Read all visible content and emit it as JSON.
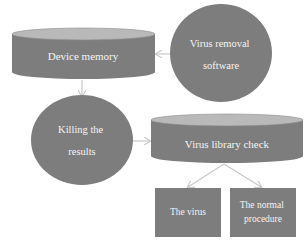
{
  "diagram": {
    "colors": {
      "shape_fill": "#7d7d7d",
      "cylinder_top": "#b9b9b9",
      "arrow": "#c8c8c8",
      "text": "#f4f4f4",
      "background": "#ffffff"
    },
    "nodes": {
      "device_memory": {
        "shape": "cylinder",
        "lines": [
          "Device memory"
        ]
      },
      "virus_removal": {
        "shape": "circle",
        "lines": [
          "Virus removal",
          "software"
        ]
      },
      "killing_results": {
        "shape": "circle",
        "lines": [
          "Killing the",
          "results"
        ]
      },
      "virus_library": {
        "shape": "cylinder",
        "lines": [
          "Virus library check"
        ]
      },
      "the_virus": {
        "shape": "rectangle",
        "lines": [
          "The virus"
        ]
      },
      "normal_procedure": {
        "shape": "rectangle",
        "lines": [
          "The normal",
          "procedure"
        ]
      }
    },
    "edges": [
      {
        "from": "virus_removal",
        "to": "device_memory"
      },
      {
        "from": "device_memory",
        "to": "killing_results"
      },
      {
        "from": "killing_results",
        "to": "virus_library"
      },
      {
        "from": "virus_library",
        "to": "the_virus"
      },
      {
        "from": "virus_library",
        "to": "normal_procedure"
      }
    ]
  }
}
